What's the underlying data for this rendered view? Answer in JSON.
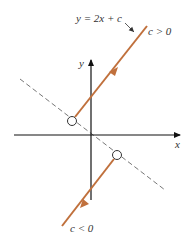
{
  "diagram": {
    "equation_label": "y = 2x + c",
    "upper_line_label": "c > 0",
    "lower_line_label": "c < 0",
    "x_axis_label": "x",
    "y_axis_label": "y",
    "colors": {
      "line": "#c0703c",
      "axis": "#111111",
      "dashed": "#777777",
      "text": "#333333"
    }
  }
}
